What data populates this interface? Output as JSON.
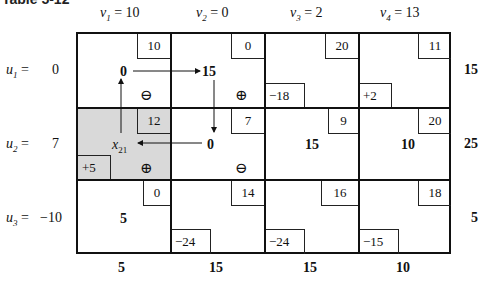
{
  "title": "Table 5-12",
  "columns": [
    {
      "label": "v",
      "sub": "1",
      "value": "= 10"
    },
    {
      "label": "v",
      "sub": "2",
      "value": "= 0"
    },
    {
      "label": "v",
      "sub": "3",
      "value": "= 2"
    },
    {
      "label": "v",
      "sub": "4",
      "value": "= 13"
    }
  ],
  "rows": [
    {
      "label": "u",
      "sub": "1",
      "eq": "=",
      "value": "0",
      "supply": "15",
      "cells": [
        {
          "cost": "10",
          "alloc": "0",
          "delta": "",
          "sign": "⊖"
        },
        {
          "cost": "0",
          "alloc": "15",
          "delta": "",
          "sign": "⊕"
        },
        {
          "cost": "20",
          "alloc": "",
          "delta": "−18",
          "sign": ""
        },
        {
          "cost": "11",
          "alloc": "",
          "delta": "+2",
          "sign": ""
        }
      ]
    },
    {
      "label": "u",
      "sub": "2",
      "eq": "=",
      "value": "7",
      "supply": "25",
      "cells": [
        {
          "cost": "12",
          "alloc": "x",
          "alloc_sub": "21",
          "delta": "+5",
          "sign": "⊕",
          "shaded": true
        },
        {
          "cost": "7",
          "alloc": "0",
          "delta": "",
          "sign": "⊖"
        },
        {
          "cost": "9",
          "alloc": "15",
          "delta": "",
          "sign": ""
        },
        {
          "cost": "20",
          "alloc": "10",
          "delta": "",
          "sign": ""
        }
      ]
    },
    {
      "label": "u",
      "sub": "3",
      "eq": "=",
      "value": "−10",
      "supply": "5",
      "cells": [
        {
          "cost": "0",
          "alloc": "5",
          "delta": "",
          "sign": ""
        },
        {
          "cost": "14",
          "alloc": "",
          "delta": "−24",
          "sign": ""
        },
        {
          "cost": "16",
          "alloc": "",
          "delta": "−24",
          "sign": ""
        },
        {
          "cost": "18",
          "alloc": "",
          "delta": "−15",
          "sign": ""
        }
      ]
    }
  ],
  "demand": [
    "5",
    "15",
    "15",
    "10"
  ]
}
